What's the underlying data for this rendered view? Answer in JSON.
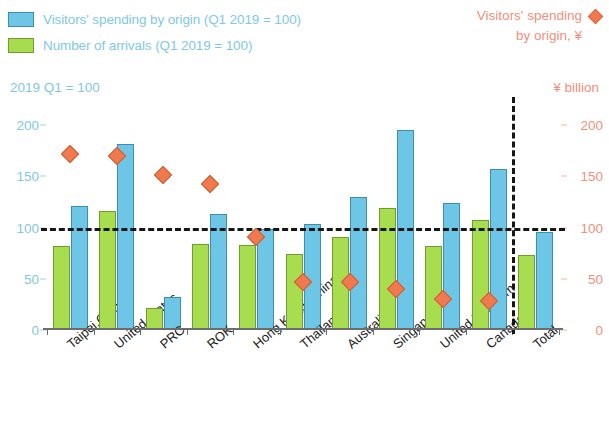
{
  "legend": {
    "left_items": [
      {
        "label": "Visitors' spending by origin (Q1 2019 = 100)",
        "color": "#6ec6e6",
        "icon": "blue-square-swatch"
      },
      {
        "label": "Number of arrivals (Q1 2019 = 100)",
        "color": "#a8dd4f",
        "icon": "green-square-swatch"
      }
    ],
    "right_line1": "Visitors' spending",
    "right_line2": "by origin, ¥",
    "right_color": "#f07a50",
    "right_icon": "orange-diamond-marker"
  },
  "axis_units": {
    "left": "2019 Q1 = 100",
    "right": "¥ billion"
  },
  "chart_data": {
    "type": "bar",
    "title": "",
    "subtitle": "",
    "xlabel": "",
    "ylabel": "2019 Q1 = 100",
    "y2label": "¥ billion",
    "ylim": [
      0,
      200
    ],
    "y2lim": [
      0,
      200
    ],
    "yticks": [
      0,
      50,
      100,
      150,
      200
    ],
    "y2ticks": [
      0,
      50,
      100,
      150,
      200
    ],
    "ytick_labels": [
      "0",
      "50",
      "100",
      "150",
      "200"
    ],
    "y2tick_labels": [
      "0",
      "50",
      "100",
      "150",
      "200"
    ],
    "grid": false,
    "legend_position": "top",
    "reference_line": {
      "value": 100,
      "style": "dashed",
      "color": "#161616"
    },
    "divider_after_category": "Canada",
    "categories": [
      "Taipei,China",
      "United States",
      "PRC",
      "ROK",
      "Hong Kong, China",
      "Thailand",
      "Australia",
      "Singapore",
      "United Kingdom",
      "Canada",
      "Total"
    ],
    "series": [
      {
        "name": "Number of arrivals (Q1 2019 = 100)",
        "type": "bar",
        "axis": "left",
        "color": "#a8dd4f",
        "values": [
          82,
          116,
          21,
          84,
          83,
          74,
          91,
          119,
          82,
          107,
          73
        ]
      },
      {
        "name": "Visitors' spending by origin (Q1 2019 = 100)",
        "type": "bar",
        "axis": "left",
        "color": "#6ec6e6",
        "values": [
          121,
          181,
          32,
          113,
          99,
          103,
          130,
          195,
          124,
          157,
          96
        ]
      },
      {
        "name": "Visitors' spending by origin, ¥",
        "type": "scatter",
        "marker": "diamond",
        "axis": "right",
        "color": "#f07a50",
        "values": [
          172,
          170,
          151,
          142,
          91,
          47,
          47,
          40,
          30,
          28,
          null
        ]
      }
    ]
  }
}
